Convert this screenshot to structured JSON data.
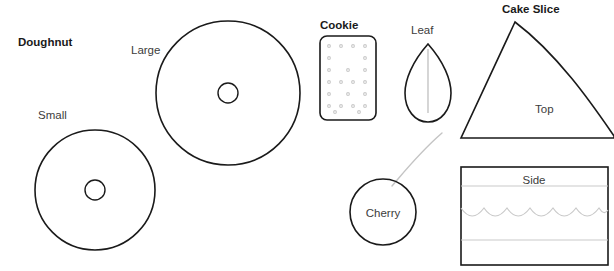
{
  "canvas": {
    "width": 614,
    "height": 271,
    "background": "#ffffff"
  },
  "palette": {
    "outline": "#1a1a1a",
    "heading_text": "#1a1a1a",
    "label_text": "#3c3c3c",
    "detail_line": "#c4c4c4",
    "chip_dot": "#c9c9c9"
  },
  "headings": {
    "doughnut": "Doughnut",
    "cookie": "Cookie",
    "cake_slice": "Cake Slice"
  },
  "labels": {
    "small": "Small",
    "large": "Large",
    "leaf": "Leaf",
    "cherry": "Cherry",
    "top": "Top",
    "side": "Side"
  },
  "shapes": [
    {
      "name": "doughnut-small",
      "group": "Doughnut",
      "label": "Small",
      "type": "annulus",
      "cx": 95,
      "cy": 190,
      "r": 60,
      "hole_r": 10
    },
    {
      "name": "doughnut-large",
      "group": "Doughnut",
      "label": "Large",
      "type": "annulus",
      "cx": 228,
      "cy": 93,
      "r": 72,
      "hole_r": 10
    },
    {
      "name": "cookie",
      "group": "Cookie",
      "label": "Cookie",
      "type": "rounded-rect",
      "x": 320,
      "y": 36,
      "width": 56,
      "height": 84,
      "corner_radius": 7,
      "chip_rows": 7,
      "chip_cols": 5
    },
    {
      "name": "leaf",
      "group": "Leaf",
      "label": "Leaf",
      "type": "teardrop",
      "cx": 428,
      "cy": 78,
      "width": 46,
      "height": 68
    },
    {
      "name": "cherry",
      "group": "Cherry",
      "label": "Cherry",
      "type": "circle-with-stem",
      "cx": 383,
      "cy": 212,
      "r": 33
    },
    {
      "name": "cake-slice-top",
      "group": "Cake Slice",
      "label": "Top",
      "type": "wedge",
      "apex_x": 515,
      "apex_y": 22,
      "left_x": 461,
      "right_x": 614,
      "base_y": 138
    },
    {
      "name": "cake-slice-side",
      "group": "Cake Slice",
      "label": "Side",
      "type": "rect-with-layers",
      "x": 461,
      "y": 167,
      "width": 147,
      "height": 98,
      "layer_lines_y": [
        186,
        240
      ],
      "scallop_y": 210,
      "scallop_count": 5
    }
  ]
}
